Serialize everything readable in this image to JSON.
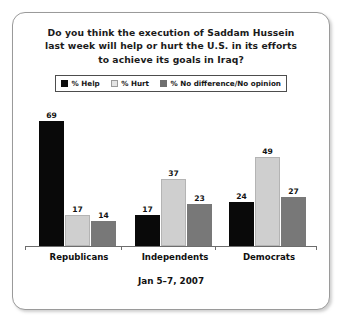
{
  "card": {
    "title_lines": [
      "Do you think the execution of Saddam Hussein",
      "last week will help or hurt the U.S. in its efforts",
      "to achieve its goals in Iraq?"
    ],
    "footer_date": "Jan 5–7, 2007"
  },
  "legend": {
    "items": [
      {
        "label": "% Help",
        "color": "#090909",
        "swatch_name": "legend-swatch-help"
      },
      {
        "label": "% Hurt",
        "color": "#cfcfcf",
        "swatch_name": "legend-swatch-hurt"
      },
      {
        "label": "% No difference/No opinion",
        "color": "#787878",
        "swatch_name": "legend-swatch-nodifference"
      }
    ]
  },
  "chart_data": {
    "type": "bar",
    "title": "Do you think the execution of Saddam Hussein last week will help or hurt the U.S. in its efforts to achieve its goals in Iraq?",
    "subtitle": "Jan 5–7, 2007",
    "categories": [
      "Republicans",
      "Independents",
      "Democrats"
    ],
    "series": [
      {
        "name": "% Help",
        "color": "#090909",
        "values": [
          69,
          17,
          24
        ]
      },
      {
        "name": "% Hurt",
        "color": "#cfcfcf",
        "values": [
          17,
          37,
          49
        ]
      },
      {
        "name": "% No difference/No opinion",
        "color": "#787878",
        "values": [
          14,
          23,
          27
        ]
      }
    ],
    "xlabel": "",
    "ylabel": "",
    "ylim": [
      0,
      75
    ],
    "grid": false,
    "legend_position": "top",
    "data_labels": true
  }
}
